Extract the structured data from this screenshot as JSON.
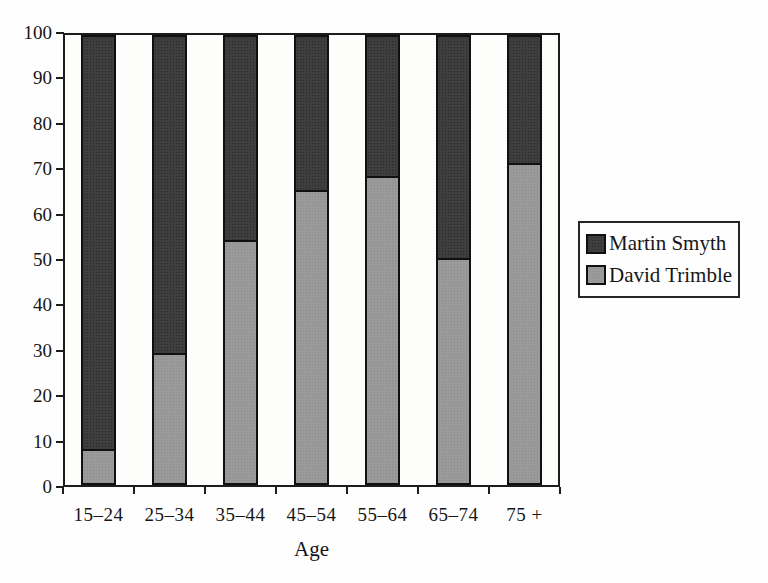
{
  "chart_data": {
    "type": "bar",
    "stacked": true,
    "title": "",
    "xlabel": "Age",
    "ylabel": "",
    "ylim": [
      0,
      100
    ],
    "yticks": [
      0,
      10,
      20,
      30,
      40,
      50,
      60,
      70,
      80,
      90,
      100
    ],
    "grid": false,
    "legend_position": "right",
    "categories": [
      "15–24",
      "25–34",
      "35–44",
      "45–54",
      "55–64",
      "65–74",
      "75 +"
    ],
    "series": [
      {
        "name": "Martin Smyth",
        "color": "#3e3e3e",
        "values": [
          92,
          71,
          46,
          35,
          32,
          50,
          29
        ]
      },
      {
        "name": "David Trimble",
        "color": "#9a9a9a",
        "values": [
          8,
          29,
          54,
          65,
          68,
          50,
          71
        ]
      }
    ]
  }
}
